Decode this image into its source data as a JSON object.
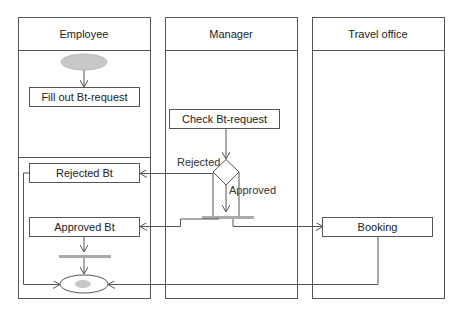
{
  "diagram": {
    "type": "UML activity diagram with swimlanes",
    "colors": {
      "line": "#555555",
      "fill": "#ffffff",
      "initial_node": "#c8c8c8",
      "bar": "#aaaaaa"
    },
    "lanes": [
      {
        "id": "employee",
        "title": "Employee"
      },
      {
        "id": "manager",
        "title": "Manager"
      },
      {
        "id": "travel",
        "title": "Travel office"
      }
    ],
    "nodes": {
      "fill_out": {
        "label": "Fill out Bt-request",
        "lane": "employee"
      },
      "check": {
        "label": "Check Bt-request",
        "lane": "manager"
      },
      "rejected": {
        "label": "Rejected Bt",
        "lane": "employee"
      },
      "approved": {
        "label": "Approved Bt",
        "lane": "employee"
      },
      "booking": {
        "label": "Booking",
        "lane": "travel"
      }
    },
    "guards": {
      "rejected": "Rejected",
      "approved": "Approved"
    }
  }
}
